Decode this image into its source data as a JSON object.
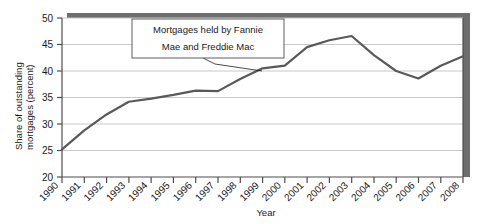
{
  "chart_data": {
    "type": "line",
    "title": "",
    "xlabel": "Year",
    "ylabel": "Share of outstanding mortgages (percent)",
    "ylabel_line1": "Share of outstanding",
    "ylabel_line2": "mortgages (percent)",
    "ylim": [
      20,
      50
    ],
    "yticks": [
      20,
      25,
      30,
      35,
      40,
      45,
      50
    ],
    "ytick_labels": [
      "20",
      "25",
      "30",
      "35",
      "40",
      "45",
      "50"
    ],
    "grid": true,
    "legend": "none",
    "categories": [
      1990,
      1991,
      1992,
      1993,
      1994,
      1995,
      1996,
      1997,
      1998,
      1999,
      2000,
      2001,
      2002,
      2003,
      2004,
      2005,
      2006,
      2007,
      2008
    ],
    "xtick_labels": [
      "1990",
      "1991",
      "1992",
      "1993",
      "1994",
      "1995",
      "1996",
      "1997",
      "1998",
      "1999",
      "2000",
      "2001",
      "2002",
      "2003",
      "2004",
      "2005",
      "2006",
      "2007",
      "2008"
    ],
    "series": [
      {
        "name": "Mortgages held by Fannie Mae and Freddie Mac",
        "color": "#595959",
        "values": [
          25.2,
          28.8,
          31.8,
          34.2,
          34.8,
          35.5,
          36.3,
          36.2,
          38.5,
          40.5,
          41.0,
          44.5,
          45.8,
          46.6,
          43.0,
          40.0,
          38.6,
          41.0,
          42.8
        ]
      }
    ],
    "annotations": [
      {
        "id": "series-callout",
        "line1": "Mortgages held by Fannie",
        "line2": "Mae and Freddie Mac",
        "points_to_year": 1999
      }
    ]
  },
  "style": {
    "line_color": "#595959",
    "grid_color": "#c8c8c8",
    "axis_color": "#4d4d4d",
    "shadow_color": "#6e6e6e",
    "plot_background": "#ffffff",
    "text_color": "#1a1a1a"
  }
}
